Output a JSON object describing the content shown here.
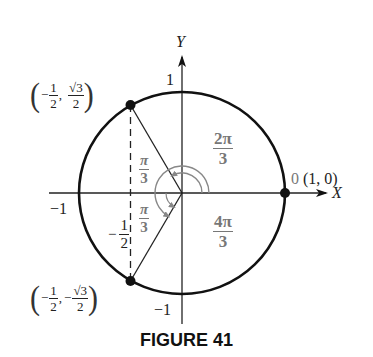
{
  "diagram": {
    "axes": {
      "x_label": "X",
      "y_label": "Y"
    },
    "ticks": {
      "y_top": "1",
      "y_bottom": "−1",
      "x_left": "−1",
      "x_half": "−",
      "half_num": "1",
      "half_den": "2"
    },
    "points": {
      "upper": {
        "sign_x": "−",
        "x_num": "1",
        "x_den": "2",
        "sign_y": "",
        "y_num": "√3",
        "y_den": "2"
      },
      "lower": {
        "sign_x": "−",
        "x_num": "1",
        "x_den": "2",
        "sign_y": "−",
        "y_num": "√3",
        "y_den": "2"
      },
      "right": {
        "angle": "0",
        "coord": "(1, 0)"
      }
    },
    "angles": {
      "upper_region": {
        "num": "2π",
        "den": "3"
      },
      "lower_region": {
        "num": "4π",
        "den": "3"
      },
      "upper_small": {
        "num": "π",
        "den": "3"
      },
      "lower_small": {
        "num": "π",
        "den": "3"
      }
    },
    "colors": {
      "stroke": "#111111",
      "angle_gray": "#808080"
    }
  },
  "caption": "FIGURE 41"
}
